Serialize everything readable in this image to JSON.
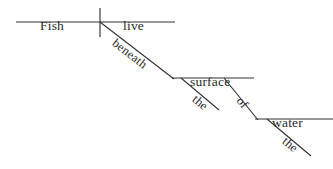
{
  "diagram": {
    "type": "reed-kellogg-sentence-diagram",
    "sentence": "Fish live beneath the surface of the water.",
    "ink_color": "#333333",
    "text_color": "#2b2b2b",
    "background_color": "#ffffff",
    "words": {
      "subject": "Fish",
      "verb": "live",
      "preposition_1": "beneath",
      "object_1": "surface",
      "article_1": "the",
      "preposition_2": "of",
      "object_2": "water",
      "article_2": "the"
    },
    "lines": [
      {
        "name": "main-baseline",
        "x1": 16,
        "y1": 22,
        "x2": 175,
        "y2": 22
      },
      {
        "name": "subject-verb-divider",
        "x1": 100,
        "y1": 8,
        "x2": 100,
        "y2": 37
      },
      {
        "name": "preposition-beneath-slant",
        "x1": 100,
        "y1": 22,
        "x2": 174,
        "y2": 79
      },
      {
        "name": "surface-baseline",
        "x1": 172,
        "y1": 78,
        "x2": 254,
        "y2": 78
      },
      {
        "name": "article-the-1-slant",
        "x1": 181,
        "y1": 78,
        "x2": 219,
        "y2": 110
      },
      {
        "name": "preposition-of-slant",
        "x1": 224,
        "y1": 78,
        "x2": 258,
        "y2": 120
      },
      {
        "name": "water-baseline",
        "x1": 255,
        "y1": 119,
        "x2": 333,
        "y2": 119
      },
      {
        "name": "article-the-2-slant",
        "x1": 267,
        "y1": 119,
        "x2": 311,
        "y2": 156
      }
    ],
    "labels": [
      {
        "name": "subject",
        "text": "Fish",
        "left": 40,
        "top": 19,
        "rotate": 0,
        "style": "horizontal"
      },
      {
        "name": "verb",
        "text": "live",
        "left": 123,
        "top": 19,
        "rotate": 0,
        "style": "horizontal"
      },
      {
        "name": "preposition-1",
        "text": "beneath",
        "left": 110,
        "top": 34,
        "rotate": 38,
        "style": "slanted"
      },
      {
        "name": "object-1",
        "text": "surface",
        "left": 190,
        "top": 75,
        "rotate": 0,
        "style": "horizontal"
      },
      {
        "name": "article-1",
        "text": "the",
        "left": 190,
        "top": 90,
        "rotate": 40,
        "style": "slanted"
      },
      {
        "name": "preposition-2",
        "text": "of",
        "left": 234,
        "top": 90,
        "rotate": 51,
        "style": "slanted"
      },
      {
        "name": "object-2",
        "text": "water",
        "left": 272,
        "top": 116,
        "rotate": 0,
        "style": "horizontal"
      },
      {
        "name": "article-2",
        "text": "the",
        "left": 280,
        "top": 132,
        "rotate": 40,
        "style": "slanted"
      }
    ]
  }
}
